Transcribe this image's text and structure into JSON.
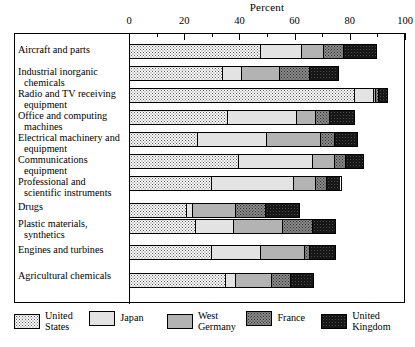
{
  "chart_data": {
    "type": "bar",
    "orientation": "horizontal",
    "stacked": true,
    "title": "Percent",
    "xlabel": "Percent",
    "ylabel": "",
    "xlim": [
      0,
      100
    ],
    "xticks": [
      0,
      20,
      40,
      60,
      80,
      100
    ],
    "xtick_labels": [
      "0",
      "20",
      "40",
      "60",
      "80",
      "100"
    ],
    "minor_ticks": [
      10,
      30,
      50,
      70,
      90
    ],
    "grid": false,
    "legend_position": "bottom",
    "categories": [
      "Aircraft and parts",
      "Industrial inorganic chemicals",
      "Radio and TV receiving equipment",
      "Office and computing machines",
      "Electrical machinery and equipment",
      "Communications equipment",
      "Professional and scientific instruments",
      "Drugs",
      "Plastic materials, synthetics",
      "Engines and turbines",
      "Agricultural chemicals"
    ],
    "category_lines": [
      [
        "Aircraft and parts"
      ],
      [
        "Industrial inorganic",
        "chemicals"
      ],
      [
        "Radio and TV receiving",
        "equipment"
      ],
      [
        "Office and computing",
        "machines"
      ],
      [
        "Electrical machinery and",
        "equipment"
      ],
      [
        "Communications",
        "equipment"
      ],
      [
        "Professional and",
        "scientific instruments"
      ],
      [
        "Drugs"
      ],
      [
        "Plastic materials,",
        "synthetics"
      ],
      [
        "Engines and turbines"
      ],
      [
        "Agricultural chemicals"
      ]
    ],
    "series": [
      {
        "name": "United States",
        "values": [
          48,
          34,
          82,
          36,
          25,
          40,
          30,
          21,
          24,
          30,
          35
        ]
      },
      {
        "name": "Japan",
        "values": [
          15,
          7,
          7,
          25,
          25,
          27,
          30,
          2,
          14,
          18,
          4
        ]
      },
      {
        "name": "West Germany",
        "values": [
          8,
          14,
          1,
          7,
          20,
          8,
          8,
          16,
          18,
          16,
          13
        ]
      },
      {
        "name": "France",
        "values": [
          7,
          11,
          1,
          5,
          5,
          4,
          4,
          11,
          11,
          2,
          7
        ]
      },
      {
        "name": "United Kingdom",
        "values": [
          12,
          10,
          3,
          9,
          8,
          6,
          5,
          12,
          8,
          9,
          8
        ]
      }
    ],
    "totals": [
      90,
      76,
      94,
      82,
      83,
      85,
      77,
      62,
      75,
      75,
      67
    ]
  },
  "legend": {
    "entries": [
      {
        "key": "us",
        "lines": [
          "United",
          "States"
        ]
      },
      {
        "key": "jp",
        "lines": [
          "Japan"
        ]
      },
      {
        "key": "wg",
        "lines": [
          "West",
          "Germany"
        ]
      },
      {
        "key": "fr",
        "lines": [
          "France"
        ]
      },
      {
        "key": "uk",
        "lines": [
          "United",
          "Kingdom"
        ]
      }
    ]
  },
  "colors": {
    "united_states": "#fdfdfd",
    "japan": "#e3e3e3",
    "west_germany": "#b3b3b3",
    "france": "#8a8a8a",
    "united_kingdom": "#171717",
    "axis": "#000000",
    "background": "#ffffff"
  }
}
